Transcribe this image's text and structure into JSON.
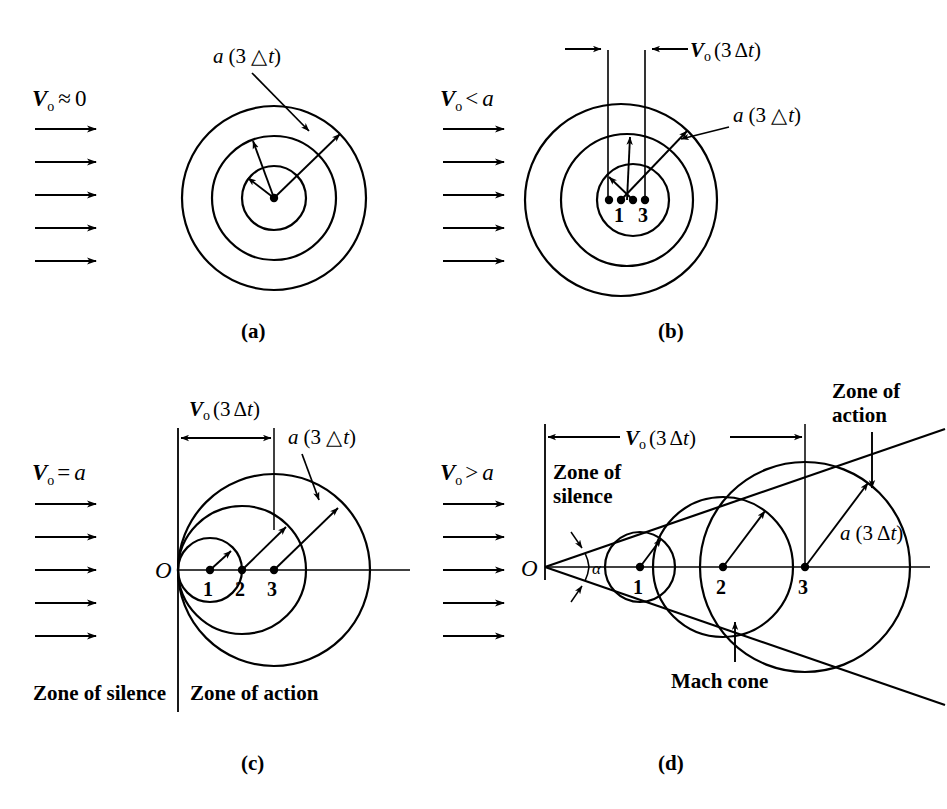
{
  "figure": {
    "stroke_color": "#000000",
    "background": "#ffffff"
  },
  "panels": [
    {
      "id": "a",
      "caption": "(a)",
      "velocity_label": {
        "symbol": "V",
        "subscript": "o",
        "relation": "≈",
        "value": "0",
        "full": "Vₒ ≈ 0"
      },
      "flow_arrows": 5,
      "annotation": {
        "text": "a (3 △t)",
        "lead": "arrow-to-outer-circle"
      },
      "circles": [
        {
          "index": 1,
          "cx": 274,
          "cy": 198,
          "r": 32
        },
        {
          "index": 2,
          "cx": 274,
          "cy": 198,
          "r": 62
        },
        {
          "index": 3,
          "cx": 274,
          "cy": 198,
          "r": 92
        }
      ],
      "source_points": [
        {
          "label": "",
          "x": 274,
          "y": 198
        }
      ],
      "radius_arrows": 3
    },
    {
      "id": "b",
      "caption": "(b)",
      "velocity_label": {
        "symbol": "V",
        "subscript": "o",
        "relation": "<",
        "value": "a",
        "full": "Vₒ < a"
      },
      "flow_arrows": 5,
      "annotations": [
        {
          "text": "Vₒ (3 Δt)",
          "kind": "dimension",
          "x1": 608,
          "x2": 645
        },
        {
          "text": "a (3 △t)",
          "kind": "leader"
        }
      ],
      "circles": [
        {
          "index": 1,
          "cx": 633,
          "cy": 200,
          "r": 36
        },
        {
          "index": 2,
          "cx": 627,
          "cy": 200,
          "r": 66
        },
        {
          "index": 3,
          "cx": 621,
          "cy": 200,
          "r": 96
        }
      ],
      "source_points": [
        {
          "label": "",
          "x": 609,
          "y": 200
        },
        {
          "label": "1",
          "x": 621,
          "y": 200
        },
        {
          "label": "",
          "x": 633,
          "y": 200
        },
        {
          "label": "3",
          "x": 645,
          "y": 200
        }
      ],
      "radius_arrows": 3
    },
    {
      "id": "c",
      "caption": "(c)",
      "velocity_label": {
        "symbol": "V",
        "subscript": "o",
        "relation": "=",
        "value": "a",
        "full": "Vₒ = a"
      },
      "flow_arrows": 5,
      "origin_label": "O",
      "annotations": [
        {
          "text": "Vₒ (3 Δt)",
          "kind": "dimension",
          "x1": 178,
          "x2": 274
        },
        {
          "text": "a (3 △t)",
          "kind": "leader"
        }
      ],
      "zone_labels": [
        "Zone of silence",
        "Zone of action"
      ],
      "circles": [
        {
          "index": 1,
          "cx": 210,
          "cy": 570,
          "r": 32
        },
        {
          "index": 2,
          "cx": 242,
          "cy": 570,
          "r": 64
        },
        {
          "index": 3,
          "cx": 274,
          "cy": 570,
          "r": 96
        }
      ],
      "source_points": [
        {
          "label": "1",
          "x": 210,
          "y": 570
        },
        {
          "label": "2",
          "x": 242,
          "y": 570
        },
        {
          "label": "3",
          "x": 274,
          "y": 570
        }
      ],
      "radius_arrows": 3
    },
    {
      "id": "d",
      "caption": "(d)",
      "velocity_label": {
        "symbol": "V",
        "subscript": "o",
        "relation": ">",
        "value": "a",
        "full": "Vₒ > a"
      },
      "flow_arrows": 5,
      "origin_label": "O",
      "mach_angle_label": "α",
      "mach_angle_degrees": 19,
      "annotations": [
        {
          "text": "Vₒ (3 Δt)",
          "kind": "dimension",
          "x1": 545,
          "x2": 805
        },
        {
          "text": "a (3 Δt)",
          "kind": "leader"
        },
        {
          "text": "Mach cone",
          "kind": "leader-up"
        },
        {
          "text": "Zone of action",
          "kind": "leader-down"
        },
        {
          "text": "Zone of silence",
          "kind": "static"
        }
      ],
      "circles": [
        {
          "index": 1,
          "cx": 640,
          "cy": 567,
          "r": 35
        },
        {
          "index": 2,
          "cx": 723,
          "cy": 567,
          "r": 70
        },
        {
          "index": 3,
          "cx": 805,
          "cy": 567,
          "r": 105
        }
      ],
      "source_points": [
        {
          "label": "1",
          "x": 640,
          "y": 567
        },
        {
          "label": "2",
          "x": 723,
          "y": 567
        },
        {
          "label": "3",
          "x": 805,
          "y": 567
        }
      ],
      "radius_arrows": 3
    }
  ],
  "text": {
    "v_symbol": "V",
    "v_subscript": "o",
    "rel_approx": "≈",
    "rel_lt": "<",
    "rel_eq": "=",
    "rel_gt": ">",
    "zero": "0",
    "a_italic": "a",
    "a3dt_open": "a (3 △t)",
    "a3dt_solid": "a (3 Δt)",
    "v3dt": "(3 Δt)",
    "zone_of_silence": "Zone of silence",
    "zone_of_action": "Zone of action",
    "zone_of": "Zone of",
    "silence_word": "silence",
    "action_word": "action",
    "mach_cone": "Mach cone",
    "origin": "O",
    "alpha": "α",
    "n1": "1",
    "n2": "2",
    "n3": "3",
    "cap_a": "(a)",
    "cap_b": "(b)",
    "cap_c": "(c)",
    "cap_d": "(d)"
  }
}
